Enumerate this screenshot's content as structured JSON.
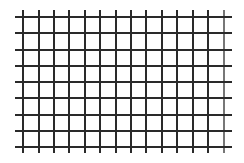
{
  "grid": {
    "line_color": "#2a2a2a",
    "last_vline_color": "#777777",
    "background": "#ffffff",
    "vertical_lines_x": [
      23,
      39,
      54,
      69,
      85,
      100,
      116,
      131,
      146,
      162,
      177,
      193,
      208,
      224
    ],
    "vertical_extent": [
      10,
      153
    ],
    "horizontal_lines_y": [
      17,
      33,
      50,
      66,
      82,
      98,
      115,
      131,
      147
    ],
    "horizontal_extent": [
      15,
      232
    ]
  }
}
